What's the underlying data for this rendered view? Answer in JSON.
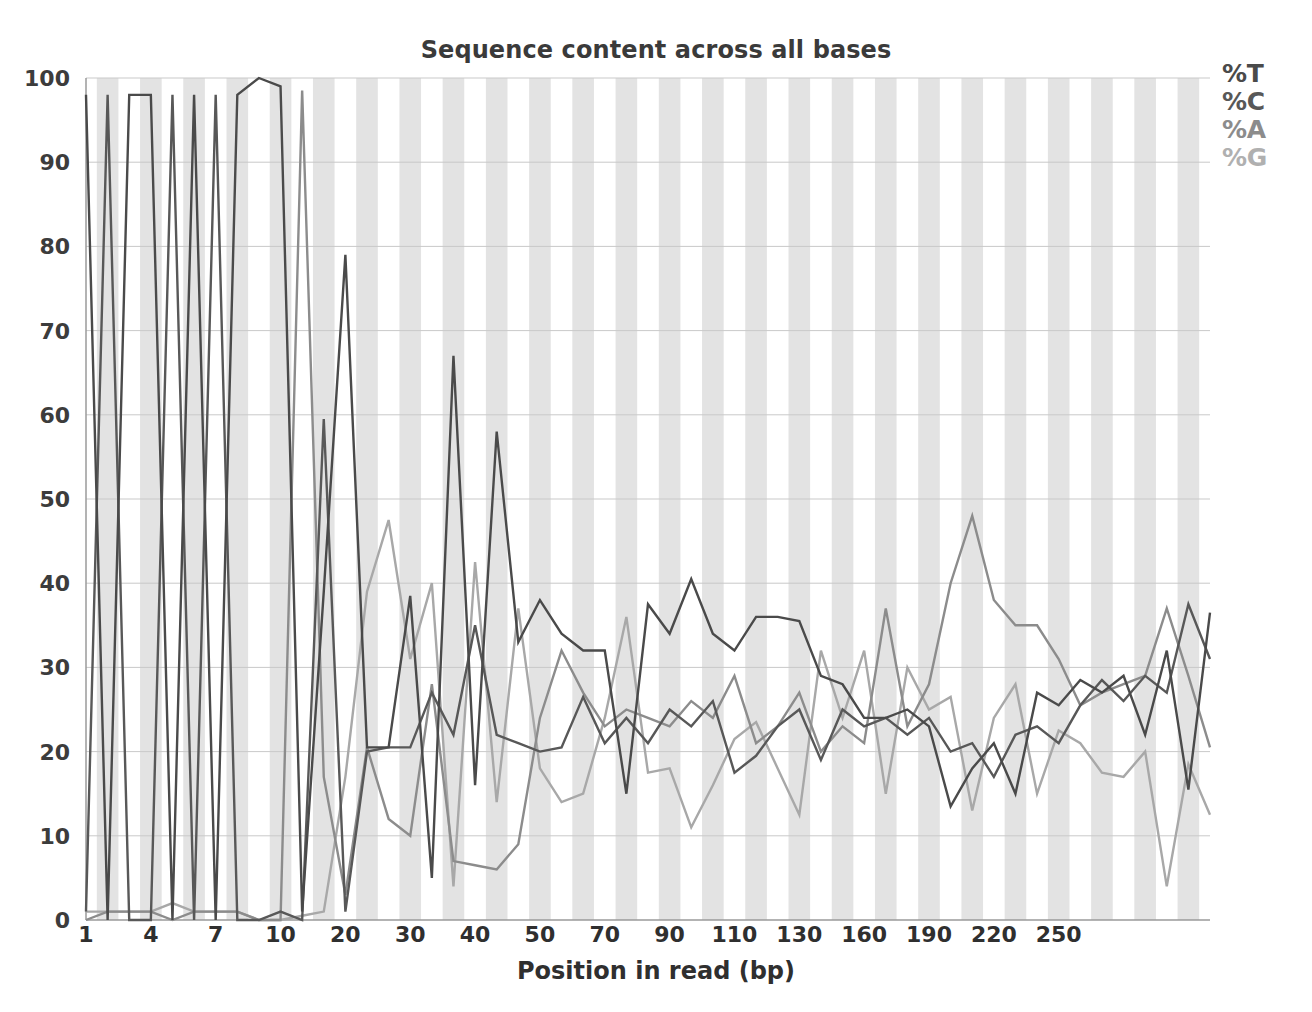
{
  "chart_data": {
    "type": "line",
    "title": "Sequence content across all bases",
    "xlabel": "Position in read (bp)",
    "ylabel": "",
    "ylim": [
      0,
      100
    ],
    "grid": true,
    "legend_position": "top-right",
    "xtick_labels": [
      "1",
      "4",
      "7",
      "10",
      "20",
      "30",
      "40",
      "50",
      "70",
      "90",
      "110",
      "130",
      "160",
      "190",
      "220",
      "250"
    ],
    "xtick_indices": [
      0,
      3,
      6,
      9,
      12,
      15,
      18,
      21,
      24,
      27,
      30,
      33,
      36,
      39,
      42,
      45
    ],
    "ytick_labels": [
      "0",
      "10",
      "20",
      "30",
      "40",
      "50",
      "60",
      "70",
      "80",
      "90",
      "100"
    ],
    "ytick_values": [
      0,
      10,
      20,
      30,
      40,
      50,
      60,
      70,
      80,
      90,
      100
    ],
    "x": [
      "1",
      "2",
      "3",
      "4",
      "5",
      "6",
      "7",
      "8",
      "9",
      "10",
      "11-12",
      "13-14",
      "15-16",
      "17-18",
      "19-20",
      "21-22",
      "23-24",
      "25-26",
      "27-28",
      "29-30",
      "31-32",
      "33-34",
      "35-36",
      "37-38",
      "39-40",
      "41-45",
      "46-50",
      "51-55",
      "56-60",
      "61-65",
      "66-70",
      "71-75",
      "76-80",
      "81-85",
      "86-90",
      "91-95",
      "96-100",
      "101-105",
      "106-110",
      "111-120",
      "121-130",
      "131-140",
      "141-150",
      "151-160",
      "161-170",
      "171-180",
      "181-190",
      "191-200",
      "201-210",
      "211-220",
      "221-230",
      "231-240",
      "241-250"
    ],
    "series": [
      {
        "name": "%T",
        "color": "#4a4a4a",
        "values": [
          98,
          0,
          98,
          98,
          0,
          98,
          0,
          98,
          100,
          99,
          1,
          39,
          79,
          20.5,
          20.5,
          38.5,
          5,
          67,
          16,
          58,
          33,
          38,
          34,
          32,
          32,
          15,
          37.5,
          34,
          40.5,
          34,
          32,
          36,
          36,
          35.5,
          29,
          28,
          24,
          24,
          25,
          23,
          13.5,
          18,
          21,
          15,
          27,
          25.5,
          28.5,
          27,
          29,
          22,
          32,
          15.5,
          36.5
        ]
      },
      {
        "name": "%C",
        "color": "#585858",
        "values": [
          1,
          98,
          0,
          0,
          98,
          0,
          98,
          0,
          0,
          1,
          0,
          59.5,
          1,
          20,
          20.5,
          20.5,
          27,
          22,
          35,
          22,
          21,
          20,
          20.5,
          26.5,
          21,
          24,
          21,
          25,
          23,
          26,
          17.5,
          19.5,
          23,
          25,
          19,
          25,
          23,
          24,
          22,
          24,
          20,
          21,
          17,
          22,
          23,
          21,
          25.5,
          28.5,
          26,
          29,
          27,
          37.5,
          31
        ]
      },
      {
        "name": "%A",
        "color": "#8c8c8c",
        "values": [
          0,
          1,
          1,
          1,
          0,
          1,
          1,
          1,
          0,
          0,
          98.5,
          17,
          3,
          20.5,
          12,
          10,
          28,
          7,
          6.5,
          6,
          9,
          24,
          32,
          27,
          23,
          25,
          24,
          23,
          26,
          24,
          29,
          21,
          23,
          27,
          20,
          23,
          21,
          37,
          23,
          28,
          40,
          48,
          38,
          35,
          35,
          31,
          25.5,
          27,
          28,
          29,
          37,
          29,
          20.5
        ]
      },
      {
        "name": "%G",
        "color": "#a8a8a8",
        "values": [
          1,
          1,
          1,
          1,
          2,
          1,
          1,
          1,
          0,
          0,
          0.5,
          1,
          17,
          39,
          47.5,
          31,
          40,
          4,
          42.5,
          14,
          37,
          18,
          14,
          15,
          24,
          36,
          17.5,
          18,
          11,
          16,
          21.5,
          23.5,
          18,
          12.5,
          32,
          24,
          32,
          15,
          30,
          25,
          26.5,
          13,
          24,
          28,
          15,
          22.5,
          21,
          17.5,
          17,
          20,
          4,
          18.5,
          12.5
        ]
      }
    ]
  },
  "legend": {
    "items": [
      {
        "label": "%T",
        "color": "#4a4a4a"
      },
      {
        "label": "%C",
        "color": "#585858"
      },
      {
        "label": "%A",
        "color": "#8c8c8c"
      },
      {
        "label": "%G",
        "color": "#b0b0b0"
      }
    ]
  },
  "plot_style": {
    "band_color": "#e3e3e3",
    "grid_color": "#c9c9c9",
    "axis_color": "#9a9a9a",
    "background": "#ffffff"
  }
}
